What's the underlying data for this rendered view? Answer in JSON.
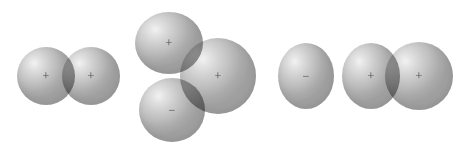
{
  "figure": {
    "background_color": "#ffffff",
    "lobe_fill_color": "#c6c6c6",
    "lobe_highlight_color": "#f2f2f2",
    "lobe_shadow_color": "#a0a0a0",
    "overlap_color": "#8f8f8f",
    "sign_color": "#4a4a4a",
    "groups": [
      {
        "name": "group-left",
        "label": "two-lobe overlap",
        "lobes": [
          {
            "name": "lobe-left",
            "sign": "+",
            "cx": 46,
            "cy": 76,
            "rx": 29,
            "ry": 29
          },
          {
            "name": "lobe-right",
            "sign": "+",
            "cx": 91,
            "cy": 76,
            "rx": 29,
            "ry": 29
          }
        ]
      },
      {
        "name": "group-middle",
        "label": "three-lobe overlap",
        "lobes": [
          {
            "name": "lobe-top-left",
            "sign": "+",
            "cx": 169,
            "cy": 43,
            "rx": 34,
            "ry": 31
          },
          {
            "name": "lobe-bottom-left",
            "sign": "-",
            "cx": 172,
            "cy": 110,
            "rx": 33,
            "ry": 32
          },
          {
            "name": "lobe-right",
            "sign": "+",
            "cx": 218,
            "cy": 76,
            "rx": 38,
            "ry": 38
          }
        ]
      },
      {
        "name": "group-right",
        "label": "three-lobe chain",
        "lobes": [
          {
            "name": "lobe-left",
            "sign": "-",
            "cx": 306,
            "cy": 76,
            "rx": 28,
            "ry": 33
          },
          {
            "name": "lobe-middle",
            "sign": "+",
            "cx": 371,
            "cy": 76,
            "rx": 29,
            "ry": 33
          },
          {
            "name": "lobe-right",
            "sign": "+",
            "cx": 419,
            "cy": 76,
            "rx": 34,
            "ry": 34
          }
        ]
      }
    ]
  }
}
